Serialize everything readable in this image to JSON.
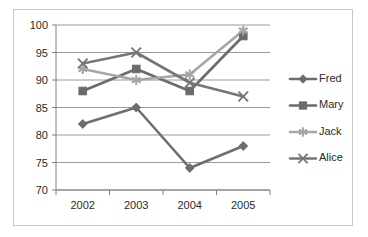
{
  "chart_data": {
    "type": "line",
    "title": "",
    "xlabel": "",
    "ylabel": "",
    "categories": [
      "2002",
      "2003",
      "2004",
      "2005"
    ],
    "ylim": [
      70,
      100
    ],
    "yticks": [
      70,
      75,
      80,
      85,
      90,
      95,
      100
    ],
    "ytick_labels": [
      "70",
      "75",
      "80",
      "85",
      "90",
      "95",
      "100"
    ],
    "grid": true,
    "grid_axis": "y",
    "legend_position": "right",
    "series": [
      {
        "name": "Fred",
        "marker": "diamond",
        "color": "#6e6e6e",
        "values": [
          82,
          85,
          74,
          78
        ]
      },
      {
        "name": "Mary",
        "marker": "square",
        "color": "#6b6b6b",
        "values": [
          88,
          92,
          88,
          98
        ]
      },
      {
        "name": "Jack",
        "marker": "star",
        "color": "#a6a6a6",
        "values": [
          92,
          90,
          91,
          99
        ]
      },
      {
        "name": "Alice",
        "marker": "cross",
        "color": "#767676",
        "values": [
          93,
          95,
          89.5,
          87
        ]
      }
    ],
    "colors": {
      "axis": "#7f7f7f",
      "gridline": "#9a9a9a",
      "text": "#2b2b2b",
      "frame_border": "#c9c9c9",
      "plot_background": "#ffffff"
    }
  }
}
